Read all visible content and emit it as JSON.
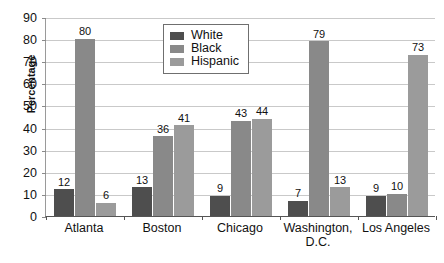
{
  "chart_data": {
    "type": "bar",
    "title": "",
    "subtitle": "",
    "xlabel": "",
    "ylabel": "Percentage",
    "ylim": [
      0,
      90
    ],
    "ystep": 10,
    "grid": true,
    "legend_position": "top-center",
    "categories": [
      "Atlanta",
      "Boston",
      "Chicago",
      "Washington, D.C.",
      "Los Angeles"
    ],
    "category_lines": [
      [
        "Atlanta"
      ],
      [
        "Boston"
      ],
      [
        "Chicago"
      ],
      [
        "Washington,",
        "D.C."
      ],
      [
        "Los Angeles"
      ]
    ],
    "series": [
      {
        "name": "White",
        "color": "#4e4e4e",
        "values": [
          12,
          13,
          9,
          7,
          9
        ]
      },
      {
        "name": "Black",
        "color": "#898989",
        "values": [
          80,
          36,
          43,
          79,
          10
        ]
      },
      {
        "name": "Hispanic",
        "color": "#9b9b9b",
        "values": [
          6,
          41,
          44,
          13,
          73
        ]
      }
    ],
    "ytick_labels": [
      "90",
      "80",
      "70",
      "60",
      "50",
      "40",
      "30",
      "20",
      "10",
      "0"
    ],
    "data_labels": {
      "Atlanta": {
        "White": "12",
        "Black": "80",
        "Hispanic": "6"
      },
      "Boston": {
        "White": "13",
        "Black": "36",
        "Hispanic": "41"
      },
      "Chicago": {
        "White": "9",
        "Black": "43",
        "Hispanic": "44"
      },
      "Washington, D.C.": {
        "White": "7",
        "Black": "79",
        "Hispanic": "13"
      },
      "Los Angeles": {
        "White": "9",
        "Black": "10",
        "Hispanic": "73"
      }
    }
  },
  "legend": {
    "items": [
      {
        "label": "White"
      },
      {
        "label": "Black"
      },
      {
        "label": "Hispanic"
      }
    ]
  }
}
